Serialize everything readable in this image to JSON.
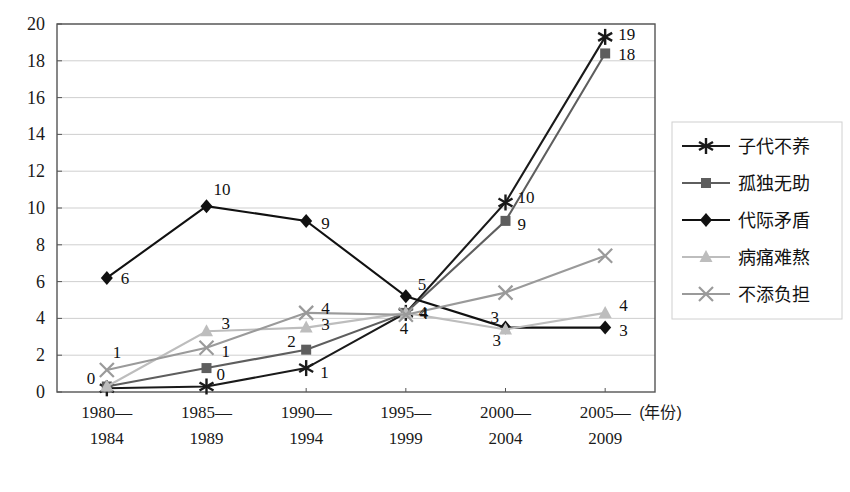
{
  "chart_data": {
    "type": "line",
    "title": "",
    "subtitle": "",
    "xlabel": "(年份)",
    "ylabel": "",
    "categories": [
      "1980—1984",
      "1985—1989",
      "1990—1994",
      "1995—1999",
      "2000—2004",
      "2005—2009"
    ],
    "categories_lines": [
      [
        "1980—",
        "1984"
      ],
      [
        "1985—",
        "1989"
      ],
      [
        "1990—",
        "1994"
      ],
      [
        "1995—",
        "1999"
      ],
      [
        "2000—",
        "2004"
      ],
      [
        "2005—",
        "2009"
      ]
    ],
    "ylim": [
      0,
      20
    ],
    "ytick_step": 2,
    "yticks": [
      "20",
      "18",
      "16",
      "14",
      "12",
      "10",
      "8",
      "6",
      "4",
      "2",
      "0"
    ],
    "grid": "horizontal",
    "legend_position": "right",
    "series": [
      {
        "name": "子代不养",
        "marker": "asterisk",
        "color": "#1a1a1a",
        "values": [
          0.2,
          0.3,
          1.3,
          4.3,
          10.3,
          19.3
        ],
        "labels": [
          "0",
          "0",
          "1",
          "4",
          "10",
          "19"
        ]
      },
      {
        "name": "孤独无助",
        "marker": "square",
        "color": "#5e5e5e",
        "values": [
          0.3,
          1.3,
          2.3,
          4.3,
          9.3,
          18.4
        ],
        "labels": [
          "0",
          "",
          "2",
          "4",
          "9",
          "18"
        ]
      },
      {
        "name": "代际矛盾",
        "marker": "diamond",
        "color": "#111111",
        "values": [
          6.2,
          10.1,
          9.3,
          5.2,
          3.5,
          3.5
        ],
        "labels": [
          "6",
          "10",
          "9",
          "5",
          "3",
          "3"
        ]
      },
      {
        "name": "病痛难熬",
        "marker": "triangle",
        "color": "#bdbdbd",
        "values": [
          0.3,
          3.3,
          3.5,
          4.3,
          3.4,
          4.3
        ],
        "labels": [
          "",
          "3",
          "3",
          "4",
          "3",
          "4"
        ]
      },
      {
        "name": "不添负担",
        "marker": "x",
        "color": "#9a9a9a",
        "values": [
          1.2,
          2.4,
          4.3,
          4.2,
          5.4,
          7.4
        ],
        "labels": [
          "1",
          "1",
          "4",
          "4",
          "",
          ""
        ]
      }
    ],
    "point_labels": [
      {
        "series": "代际矛盾",
        "category_index": 0,
        "text": "6",
        "dx": 14,
        "dy": 6
      },
      {
        "series": "代际矛盾",
        "category_index": 1,
        "text": "10",
        "dx": 7,
        "dy": -11
      },
      {
        "series": "代际矛盾",
        "category_index": 2,
        "text": "9",
        "dx": 15,
        "dy": 8
      },
      {
        "series": "代际矛盾",
        "category_index": 3,
        "text": "5",
        "dx": 12,
        "dy": -6
      },
      {
        "series": "代际矛盾",
        "category_index": 4,
        "text": "3",
        "dx": -13,
        "dy": 18
      },
      {
        "series": "代际矛盾",
        "category_index": 5,
        "text": "3",
        "dx": 14,
        "dy": 8
      },
      {
        "series": "子代不养",
        "category_index": 0,
        "text": "0",
        "dx": -20,
        "dy": -4
      },
      {
        "series": "子代不养",
        "category_index": 1,
        "text": "0",
        "dx": 10,
        "dy": -6
      },
      {
        "series": "子代不养",
        "category_index": 2,
        "text": "1",
        "dx": 14,
        "dy": 10
      },
      {
        "series": "子代不养",
        "category_index": 3,
        "text": "4",
        "dx": 13,
        "dy": 5
      },
      {
        "series": "子代不养",
        "category_index": 4,
        "text": "10",
        "dx": 12,
        "dy": 1
      },
      {
        "series": "子代不养",
        "category_index": 5,
        "text": "19",
        "dx": 13,
        "dy": 3
      },
      {
        "series": "孤独无助",
        "category_index": 2,
        "text": "2",
        "dx": -19,
        "dy": -3
      },
      {
        "series": "孤独无助",
        "category_index": 3,
        "text": "4",
        "dx": -6,
        "dy": 21
      },
      {
        "series": "孤独无助",
        "category_index": 4,
        "text": "9",
        "dx": 12,
        "dy": 9
      },
      {
        "series": "孤独无助",
        "category_index": 5,
        "text": "18",
        "dx": 13,
        "dy": 7
      },
      {
        "series": "病痛难熬",
        "category_index": 1,
        "text": "3",
        "dx": 15,
        "dy": -2
      },
      {
        "series": "病痛难熬",
        "category_index": 2,
        "text": "3",
        "dx": 15,
        "dy": 2
      },
      {
        "series": "病痛难熬",
        "category_index": 4,
        "text": "3",
        "dx": -15,
        "dy": -6
      },
      {
        "series": "病痛难熬",
        "category_index": 5,
        "text": "4",
        "dx": 14,
        "dy": -2
      },
      {
        "series": "不添负担",
        "category_index": 0,
        "text": "1",
        "dx": 6,
        "dy": -12
      },
      {
        "series": "不添负担",
        "category_index": 1,
        "text": "1",
        "dx": 15,
        "dy": 9
      },
      {
        "series": "不添负担",
        "category_index": 2,
        "text": "4",
        "dx": 15,
        "dy": 1
      },
      {
        "series": "不添负担",
        "category_index": 3,
        "text": "4",
        "dx": 14,
        "dy": 4
      }
    ]
  },
  "legend": {
    "items": [
      {
        "label": "子代不养",
        "marker": "asterisk",
        "color": "#1a1a1a"
      },
      {
        "label": "孤独无助",
        "marker": "square",
        "color": "#5e5e5e"
      },
      {
        "label": "代际矛盾",
        "marker": "diamond",
        "color": "#111111"
      },
      {
        "label": "病痛难熬",
        "marker": "triangle",
        "color": "#bdbdbd"
      },
      {
        "label": "不添负担",
        "marker": "x",
        "color": "#9a9a9a"
      }
    ]
  },
  "colors": {
    "background": "#ffffff",
    "axis": "#555555",
    "grid": "#c9c9c9",
    "text": "#111111"
  }
}
